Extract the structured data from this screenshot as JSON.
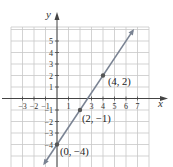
{
  "chart_data": {
    "type": "line",
    "title": "",
    "xlabel": "x",
    "ylabel": "y",
    "xlim": [
      -4,
      8
    ],
    "ylim": [
      -6,
      6
    ],
    "grid": true,
    "x_ticks": [
      "-3",
      "-2",
      "-1",
      "1",
      "3",
      "4",
      "5",
      "6",
      "7"
    ],
    "y_ticks": [
      "5",
      "4",
      "3",
      "2",
      "1",
      "-1",
      "-2",
      "-3",
      "-4"
    ],
    "series": [
      {
        "name": "line",
        "equation": "y = (3/2)x - 4",
        "slope": 1.5,
        "intercept": -4,
        "x": [
          -1.1,
          6.6
        ],
        "y": [
          -5.65,
          5.9
        ]
      }
    ],
    "points": [
      {
        "x": 4,
        "y": 2,
        "label": "(4, 2)"
      },
      {
        "x": 2,
        "y": -1,
        "label": "(2, −1)"
      },
      {
        "x": 0,
        "y": -4,
        "label": "(0, −4)"
      }
    ],
    "colors": {
      "grid": "#c8c8c8",
      "axis": "#444444",
      "line": "#7a8393",
      "point": "#555555"
    }
  }
}
